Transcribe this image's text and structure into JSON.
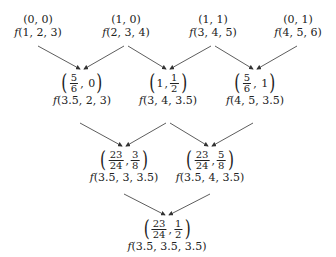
{
  "diagram": {
    "type": "tree-diagram",
    "level0": [
      {
        "coord": "(0, 0)",
        "f_args": "(1, 2, 3)"
      },
      {
        "coord": "(1, 0)",
        "f_args": "(2, 3, 4)"
      },
      {
        "coord": "(1, 1)",
        "f_args": "(3, 4, 5)"
      },
      {
        "coord": "(0, 1)",
        "f_args": "(4, 5, 6)"
      }
    ],
    "level1": [
      {
        "a_num": "5",
        "a_den": "6",
        "b": "0",
        "f_args": "(3.5, 2, 3)"
      },
      {
        "a": "1",
        "b_num": "1",
        "b_den": "2",
        "f_args": "(3, 4, 3.5)"
      },
      {
        "a_num": "5",
        "a_den": "6",
        "b": "1",
        "f_args": "(4, 5, 3.5)"
      }
    ],
    "level2": [
      {
        "a_num": "23",
        "a_den": "24",
        "b_num": "3",
        "b_den": "8",
        "f_args": "(3.5, 3, 3.5)"
      },
      {
        "a_num": "23",
        "a_den": "24",
        "b_num": "5",
        "b_den": "8",
        "f_args": "(3.5, 4, 3.5)"
      }
    ],
    "level3": [
      {
        "a_num": "23",
        "a_den": "24",
        "b_num": "1",
        "b_den": "2",
        "f_args": "(3.5, 3.5, 3.5)"
      }
    ],
    "symbols": {
      "f": "f",
      "lparen": "(",
      "rparen": ")",
      "comma": ","
    },
    "colors": {
      "line": "#333333",
      "text": "#222222",
      "background": "#ffffff"
    }
  }
}
